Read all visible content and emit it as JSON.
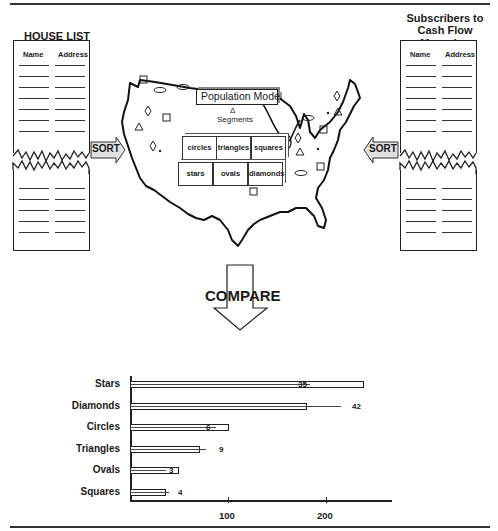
{
  "left_list": {
    "title": "HOUSE LIST",
    "columns": [
      "Name",
      "Address"
    ],
    "top_rows": 7,
    "bottom_rows": 5
  },
  "right_list": {
    "title_line1": "Subscribers to",
    "title_line2": "Cash Flow Magazine",
    "columns": [
      "Name",
      "Address"
    ],
    "top_rows": 7,
    "bottom_rows": 5
  },
  "left_sort_label": "SORT",
  "right_sort_label": "SORT",
  "map": {
    "model_label": "Population Model",
    "segments_symbol": "Δ",
    "segments_label": "Segments",
    "cubes": [
      "circles",
      "triangles",
      "squares",
      "stars",
      "ovals",
      "diamonds"
    ]
  },
  "compare_label": "COMPARE",
  "chart_data": {
    "type": "bar",
    "orientation": "horizontal",
    "categories": [
      "Stars",
      "Diamonds",
      "Circles",
      "Triangles",
      "Ovals",
      "Squares"
    ],
    "series": [
      {
        "name": "bar length",
        "values": [
          239,
          181,
          101,
          71,
          50,
          37
        ]
      },
      {
        "name": "inner line length",
        "values": [
          184,
          181,
          88,
          71,
          37,
          37
        ]
      }
    ],
    "data_labels": [
      "35",
      "42",
      "6",
      "9",
      "3",
      "4"
    ],
    "xticks": [
      100,
      200
    ],
    "xlim": [
      0,
      265
    ],
    "title": "",
    "xlabel": "",
    "ylabel": "",
    "grid": false
  }
}
